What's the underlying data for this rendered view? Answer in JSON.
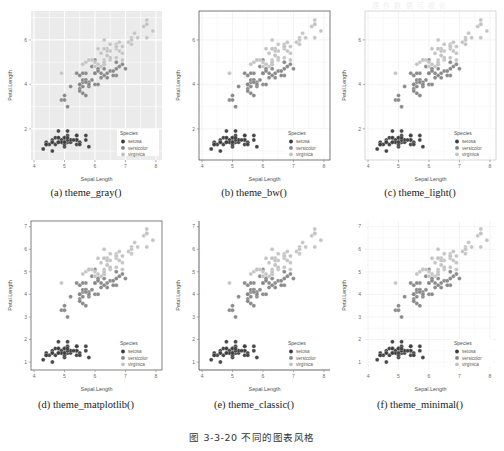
{
  "figure": {
    "caption": "图 3-3-20  不同的图表风格",
    "top_faint_text": "理 作 数 据 可 视 化"
  },
  "common": {
    "x_label": "Sepal.Length",
    "y_label": "Petal.Length",
    "legend_title": "Species",
    "legend_items": [
      {
        "label": "setosa",
        "color": "#3c3c3c"
      },
      {
        "label": "versicolor",
        "color": "#848484"
      },
      {
        "label": "virginica",
        "color": "#c2c2c2"
      }
    ],
    "x_ticks": [
      4,
      5,
      6,
      7,
      8
    ],
    "xlim": [
      3.9,
      8.2
    ],
    "point_opacity": 0.95
  },
  "panels": [
    {
      "id": "a",
      "caption": "(a) theme_gray()",
      "theme": "gray",
      "panel_bg": "#ebebeb",
      "grid_color": "#ffffff",
      "border_color": "none",
      "axis_line": "none",
      "y_ticks": [
        2,
        4,
        6
      ],
      "ylim": [
        0.6,
        7.3
      ],
      "grid_minor": true
    },
    {
      "id": "b",
      "caption": "(b) theme_bw()",
      "theme": "bw",
      "panel_bg": "#ffffff",
      "grid_color": "#ebebeb",
      "border_color": "#3f3f3f",
      "axis_line": "none",
      "y_ticks": [
        2,
        4,
        6
      ],
      "ylim": [
        0.6,
        7.3
      ],
      "grid_minor": true
    },
    {
      "id": "c",
      "caption": "(c) theme_light()",
      "theme": "light",
      "panel_bg": "#ffffff",
      "grid_color": "#ededed",
      "border_color": "#c6c6c6",
      "axis_line": "none",
      "y_ticks": [
        2,
        4,
        6
      ],
      "ylim": [
        0.6,
        7.3
      ],
      "grid_minor": true
    },
    {
      "id": "d",
      "caption": "(d) theme_matplotlib()",
      "theme": "matplotlib",
      "panel_bg": "#ffffff",
      "grid_color": "none",
      "border_color": "#4a4a4a",
      "axis_line": "none",
      "y_ticks": [
        1,
        2,
        3,
        4,
        5,
        6,
        7
      ],
      "ylim": [
        0.65,
        7.25
      ],
      "grid_minor": false
    },
    {
      "id": "e",
      "caption": "(e) theme_classic()",
      "theme": "classic",
      "panel_bg": "#ffffff",
      "grid_color": "none",
      "border_color": "none",
      "axis_line": "#3f3f3f",
      "y_ticks": [
        1,
        2,
        3,
        4,
        5,
        6,
        7
      ],
      "ylim": [
        0.65,
        7.25
      ],
      "grid_minor": false
    },
    {
      "id": "f",
      "caption": "(f) theme_minimal()",
      "theme": "minimal",
      "panel_bg": "#ffffff",
      "grid_color": "#ececec",
      "border_color": "none",
      "axis_line": "none",
      "y_ticks": [
        1,
        2,
        3,
        4,
        5,
        6,
        7
      ],
      "ylim": [
        0.65,
        7.25
      ],
      "grid_minor": true
    }
  ],
  "chart_data": {
    "type": "scatter",
    "title": "",
    "xlabel": "Sepal.Length",
    "ylabel": "Petal.Length",
    "xlim": [
      3.9,
      8.2
    ],
    "ylim": [
      0.6,
      7.3
    ],
    "grid": true,
    "legend_position": "bottom-right",
    "legend_title": "Species",
    "series": [
      {
        "name": "setosa",
        "color": "#3c3c3c",
        "x": [
          5.1,
          4.9,
          4.7,
          4.6,
          5.0,
          5.4,
          4.6,
          5.0,
          4.4,
          4.9,
          5.4,
          4.8,
          4.8,
          4.3,
          5.8,
          5.7,
          5.4,
          5.1,
          5.7,
          5.1,
          5.4,
          5.1,
          4.6,
          5.1,
          4.8,
          5.0,
          5.0,
          5.2,
          5.2,
          4.7,
          4.8,
          5.4,
          5.2,
          5.5,
          4.9,
          5.0,
          5.5,
          4.9,
          4.4,
          5.1,
          5.0,
          4.5,
          4.4,
          5.0,
          5.1,
          4.8,
          5.1,
          4.6,
          5.3,
          5.0
        ],
        "y": [
          1.4,
          1.4,
          1.3,
          1.5,
          1.4,
          1.7,
          1.4,
          1.5,
          1.4,
          1.5,
          1.5,
          1.6,
          1.4,
          1.1,
          1.2,
          1.5,
          1.3,
          1.4,
          1.7,
          1.5,
          1.7,
          1.5,
          1.0,
          1.7,
          1.9,
          1.6,
          1.6,
          1.5,
          1.4,
          1.6,
          1.6,
          1.5,
          1.5,
          1.4,
          1.5,
          1.2,
          1.3,
          1.4,
          1.3,
          1.5,
          1.3,
          1.3,
          1.3,
          1.6,
          1.9,
          1.4,
          1.6,
          1.4,
          1.5,
          1.4
        ]
      },
      {
        "name": "versicolor",
        "color": "#848484",
        "x": [
          7.0,
          6.4,
          6.9,
          5.5,
          6.5,
          5.7,
          6.3,
          4.9,
          6.6,
          5.2,
          5.0,
          5.9,
          6.0,
          6.1,
          5.6,
          6.7,
          5.6,
          5.8,
          6.2,
          5.6,
          5.9,
          6.1,
          6.3,
          6.1,
          6.4,
          6.6,
          6.8,
          6.7,
          6.0,
          5.7,
          5.5,
          5.5,
          5.8,
          6.0,
          5.4,
          6.0,
          6.7,
          6.3,
          5.6,
          5.5,
          5.5,
          6.1,
          5.8,
          5.0,
          5.6,
          5.7,
          5.7,
          6.2,
          5.1,
          5.7
        ],
        "y": [
          4.7,
          4.5,
          4.9,
          4.0,
          4.6,
          4.5,
          4.7,
          3.3,
          4.6,
          3.9,
          3.5,
          4.2,
          4.0,
          4.7,
          3.6,
          4.4,
          4.5,
          4.1,
          4.5,
          3.9,
          4.8,
          4.0,
          4.9,
          4.7,
          4.3,
          4.4,
          4.8,
          5.0,
          4.5,
          3.5,
          3.8,
          3.7,
          3.9,
          5.1,
          4.5,
          4.5,
          4.7,
          4.4,
          4.1,
          4.0,
          4.4,
          4.6,
          4.0,
          3.3,
          4.2,
          4.2,
          4.2,
          4.3,
          3.0,
          4.1
        ]
      },
      {
        "name": "virginica",
        "color": "#c2c2c2",
        "x": [
          6.3,
          5.8,
          7.1,
          6.3,
          6.5,
          7.6,
          4.9,
          7.3,
          6.7,
          7.2,
          6.5,
          6.4,
          6.8,
          5.7,
          5.8,
          6.4,
          6.5,
          7.7,
          7.7,
          6.0,
          6.9,
          5.6,
          7.7,
          6.3,
          6.7,
          7.2,
          6.2,
          6.1,
          6.4,
          7.2,
          7.4,
          7.9,
          6.4,
          6.3,
          6.1,
          7.7,
          6.3,
          6.4,
          6.0,
          6.9,
          6.7,
          6.9,
          5.8,
          6.8,
          6.7,
          6.7,
          6.3,
          6.5,
          6.2,
          5.9
        ],
        "y": [
          6.0,
          5.1,
          5.9,
          5.6,
          5.8,
          6.6,
          4.5,
          6.3,
          5.8,
          6.1,
          5.1,
          5.3,
          5.5,
          5.0,
          5.1,
          5.3,
          5.5,
          6.7,
          6.9,
          5.0,
          5.7,
          4.9,
          6.7,
          4.9,
          5.7,
          6.0,
          4.8,
          4.9,
          5.6,
          5.8,
          6.1,
          6.4,
          5.6,
          5.1,
          5.6,
          6.1,
          5.6,
          5.5,
          4.8,
          5.4,
          5.6,
          5.1,
          5.1,
          5.9,
          5.7,
          5.2,
          5.0,
          5.2,
          5.4,
          5.1
        ]
      }
    ]
  }
}
